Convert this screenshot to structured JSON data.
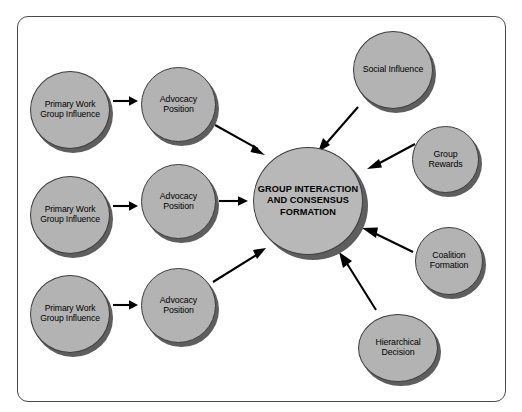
{
  "figure": {
    "frame": {
      "name": "diagram-border"
    },
    "nodes": [
      {
        "id": "pwg1",
        "label": "Primary Work Group Influence",
        "name": "node-primary-work-group-influence-1"
      },
      {
        "id": "pwg2",
        "label": "Primary Work Group Influence",
        "name": "node-primary-work-group-influence-2"
      },
      {
        "id": "pwg3",
        "label": "Primary Work Group Influence",
        "name": "node-primary-work-group-influence-3"
      },
      {
        "id": "adv1",
        "label": "Advocacy Position",
        "name": "node-advocacy-position-1"
      },
      {
        "id": "adv2",
        "label": "Advocacy Position",
        "name": "node-advocacy-position-2"
      },
      {
        "id": "adv3",
        "label": "Advocacy Position",
        "name": "node-advocacy-position-3"
      },
      {
        "id": "center",
        "label": "GROUP INTERACTION AND CONSENSUS FORMATION",
        "name": "node-group-interaction-and-consensus-formation"
      },
      {
        "id": "social",
        "label": "Social Influence",
        "name": "node-social-influence"
      },
      {
        "id": "rewards",
        "label": "Group Rewards",
        "name": "node-group-rewards"
      },
      {
        "id": "coalition",
        "label": "Coalition Formation",
        "name": "node-coalition-formation"
      },
      {
        "id": "hier",
        "label": "Hierarchical Decision",
        "name": "node-hierarchical-decision"
      }
    ],
    "arrows": [
      {
        "id": "a1",
        "name": "arrow-pwg1-to-adv1",
        "from": "pwg1",
        "to": "adv1"
      },
      {
        "id": "a2",
        "name": "arrow-pwg2-to-adv2",
        "from": "pwg2",
        "to": "adv2"
      },
      {
        "id": "a3",
        "name": "arrow-pwg3-to-adv3",
        "from": "pwg3",
        "to": "adv3"
      },
      {
        "id": "a4",
        "name": "arrow-adv1-to-center",
        "from": "adv1",
        "to": "center"
      },
      {
        "id": "a5",
        "name": "arrow-adv2-to-center",
        "from": "adv2",
        "to": "center"
      },
      {
        "id": "a6",
        "name": "arrow-adv3-to-center",
        "from": "adv3",
        "to": "center"
      },
      {
        "id": "a7",
        "name": "arrow-social-to-center",
        "from": "social",
        "to": "center"
      },
      {
        "id": "a8",
        "name": "arrow-rewards-to-center",
        "from": "rewards",
        "to": "center"
      },
      {
        "id": "a9",
        "name": "arrow-coalition-to-center",
        "from": "coalition",
        "to": "center"
      },
      {
        "id": "a10",
        "name": "arrow-hier-to-center",
        "from": "hier",
        "to": "center"
      }
    ],
    "colors": {
      "node_fill": "#b3b3b3",
      "node_stroke": "#3d3d3d",
      "node_shadow": "#5e5e5e",
      "arrow": "#000000",
      "frame_stroke": "#4a4a4a",
      "background": "#ffffff"
    }
  }
}
